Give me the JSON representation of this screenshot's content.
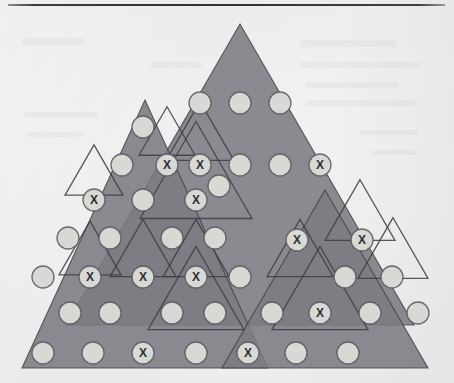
{
  "figure": {
    "marker_glyph": "X",
    "colors": {
      "page_background": "#f5f5f5",
      "triangle_fill": "#7b7b82",
      "triangle_fill_overlap": "#74747b",
      "triangle_stroke": "#3c3c42",
      "circle_fill": "#d8d8d4",
      "circle_stroke": "#56565c",
      "marker_text": "#2e2e33",
      "rule_color": "#333335"
    },
    "counts": {
      "plain_circles": 38,
      "marked_circles": 16,
      "total_circles": 54,
      "large_triangles": 3,
      "outlined_small_triangles": 12
    },
    "top_rule": {
      "visible": true,
      "x": 8,
      "y": 4,
      "width": 437,
      "height": 2
    },
    "large_triangles": [
      {
        "name": "center-large-triangle",
        "apex_x": 240,
        "apex_y": 24,
        "base_y": 325,
        "half_width": 174
      },
      {
        "name": "left-large-triangle",
        "apex_x": 145,
        "apex_y": 100,
        "base_y": 368,
        "half_width": 123
      },
      {
        "name": "right-large-triangle",
        "apex_x": 325,
        "apex_y": 190,
        "base_y": 368,
        "half_width": 103
      }
    ],
    "small_triangles": [
      {
        "name": "small-triangle-1",
        "cx": 167,
        "cy": 131,
        "half": 28
      },
      {
        "name": "small-triangle-2",
        "cx": 200,
        "cy": 131,
        "half": 34
      },
      {
        "name": "small-triangle-3",
        "cx": 196,
        "cy": 170,
        "half": 56
      },
      {
        "name": "small-triangle-4",
        "cx": 94,
        "cy": 170,
        "half": 29
      },
      {
        "name": "small-triangle-5",
        "cx": 360,
        "cy": 210,
        "half": 35
      },
      {
        "name": "small-triangle-6",
        "cx": 300,
        "cy": 248,
        "half": 33
      },
      {
        "name": "small-triangle-7",
        "cx": 393,
        "cy": 248,
        "half": 35
      },
      {
        "name": "small-triangle-8",
        "cx": 90,
        "cy": 248,
        "half": 31
      },
      {
        "name": "small-triangle-9",
        "cx": 143,
        "cy": 248,
        "half": 33
      },
      {
        "name": "small-triangle-10",
        "cx": 196,
        "cy": 248,
        "half": 33
      },
      {
        "name": "small-triangle-11",
        "cx": 320,
        "cy": 288,
        "half": 48
      },
      {
        "name": "small-triangle-12",
        "cx": 196,
        "cy": 288,
        "half": 48
      }
    ],
    "circles": [
      {
        "id": "c01",
        "x": 200,
        "y": 103,
        "marked": false
      },
      {
        "id": "c02",
        "x": 240,
        "y": 103,
        "marked": false
      },
      {
        "id": "c03",
        "x": 280,
        "y": 103,
        "marked": false
      },
      {
        "id": "c04",
        "x": 143,
        "y": 127,
        "marked": false
      },
      {
        "id": "c05",
        "x": 167,
        "y": 165,
        "marked": true
      },
      {
        "id": "c06",
        "x": 200,
        "y": 165,
        "marked": true
      },
      {
        "id": "c07",
        "x": 240,
        "y": 165,
        "marked": false
      },
      {
        "id": "c08",
        "x": 280,
        "y": 165,
        "marked": false
      },
      {
        "id": "c09",
        "x": 320,
        "y": 165,
        "marked": true
      },
      {
        "id": "c10",
        "x": 122,
        "y": 165,
        "marked": false
      },
      {
        "id": "c11",
        "x": 94,
        "y": 200,
        "marked": true
      },
      {
        "id": "c12",
        "x": 143,
        "y": 200,
        "marked": false
      },
      {
        "id": "c13",
        "x": 196,
        "y": 200,
        "marked": true
      },
      {
        "id": "c14",
        "x": 219,
        "y": 186,
        "marked": false
      },
      {
        "id": "c15",
        "x": 68,
        "y": 238,
        "marked": false
      },
      {
        "id": "c16",
        "x": 110,
        "y": 238,
        "marked": false
      },
      {
        "id": "c17",
        "x": 172,
        "y": 238,
        "marked": false
      },
      {
        "id": "c18",
        "x": 215,
        "y": 238,
        "marked": false
      },
      {
        "id": "c19",
        "x": 297,
        "y": 240,
        "marked": true
      },
      {
        "id": "c20",
        "x": 362,
        "y": 240,
        "marked": true
      },
      {
        "id": "c21",
        "x": 43,
        "y": 277,
        "marked": false
      },
      {
        "id": "c22",
        "x": 90,
        "y": 277,
        "marked": true
      },
      {
        "id": "c23",
        "x": 143,
        "y": 277,
        "marked": true
      },
      {
        "id": "c24",
        "x": 196,
        "y": 277,
        "marked": true
      },
      {
        "id": "c25",
        "x": 240,
        "y": 277,
        "marked": false
      },
      {
        "id": "c26",
        "x": 345,
        "y": 277,
        "marked": false
      },
      {
        "id": "c27",
        "x": 392,
        "y": 277,
        "marked": false
      },
      {
        "id": "c28",
        "x": 70,
        "y": 313,
        "marked": false
      },
      {
        "id": "c29",
        "x": 110,
        "y": 313,
        "marked": false
      },
      {
        "id": "c30",
        "x": 172,
        "y": 313,
        "marked": false
      },
      {
        "id": "c31",
        "x": 215,
        "y": 313,
        "marked": false
      },
      {
        "id": "c32",
        "x": 272,
        "y": 313,
        "marked": false
      },
      {
        "id": "c33",
        "x": 320,
        "y": 313,
        "marked": true
      },
      {
        "id": "c34",
        "x": 370,
        "y": 313,
        "marked": false
      },
      {
        "id": "c35",
        "x": 418,
        "y": 313,
        "marked": false
      },
      {
        "id": "c36",
        "x": 43,
        "y": 353,
        "marked": false
      },
      {
        "id": "c37",
        "x": 93,
        "y": 353,
        "marked": false
      },
      {
        "id": "c38",
        "x": 143,
        "y": 353,
        "marked": true
      },
      {
        "id": "c39",
        "x": 196,
        "y": 353,
        "marked": false
      },
      {
        "id": "c40",
        "x": 248,
        "y": 353,
        "marked": true
      },
      {
        "id": "c41",
        "x": 296,
        "y": 353,
        "marked": false
      },
      {
        "id": "c42",
        "x": 348,
        "y": 353,
        "marked": false
      }
    ]
  }
}
